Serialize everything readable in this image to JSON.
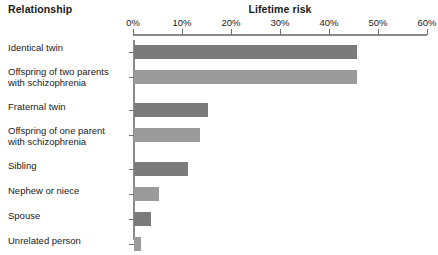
{
  "header": {
    "relationship_label": "Relationship",
    "lifetime_label": "Lifetime risk"
  },
  "axis": {
    "ticks": [
      "0%",
      "10%",
      "20%",
      "30%",
      "40%",
      "50%",
      "60%"
    ],
    "min": 0,
    "max": 60,
    "unit": "%"
  },
  "colors": {
    "bar_dark": "#7b7b7b",
    "bar_light": "#9b9b9b",
    "axis": "#8b8b8b",
    "text": "#1a1a1a",
    "background": "#ffffff"
  },
  "chart_data": {
    "type": "bar",
    "orientation": "horizontal",
    "title": "Lifetime risk",
    "xlabel": "Lifetime risk",
    "ylabel": "Relationship",
    "xlim": [
      0,
      60
    ],
    "xticks": [
      0,
      10,
      20,
      30,
      40,
      50,
      60
    ],
    "xticklabels": [
      "0%",
      "10%",
      "20%",
      "30%",
      "40%",
      "50%",
      "60%"
    ],
    "grid": false,
    "legend": false,
    "categories": [
      "Identical twin",
      "Offspring of two parents with schizophrenia",
      "Fraternal twin",
      "Offspring of one parent with schizophrenia",
      "Sibling",
      "Nephew or niece",
      "Spouse",
      "Unrelated person"
    ],
    "values": [
      45.5,
      45.5,
      15,
      13.5,
      11,
      5,
      3.5,
      1.5
    ]
  },
  "rows": [
    {
      "label_line1": "Identical twin",
      "label_line2": "",
      "value": 45.5,
      "shade": "dark"
    },
    {
      "label_line1": "Offspring of two parents",
      "label_line2": "with schizophrenia",
      "value": 45.5,
      "shade": "light"
    },
    {
      "label_line1": "Fraternal twin",
      "label_line2": "",
      "value": 15,
      "shade": "dark"
    },
    {
      "label_line1": "Offspring of one parent",
      "label_line2": "with schizophrenia",
      "value": 13.5,
      "shade": "light"
    },
    {
      "label_line1": "Sibling",
      "label_line2": "",
      "value": 11,
      "shade": "dark"
    },
    {
      "label_line1": "Nephew or niece",
      "label_line2": "",
      "value": 5,
      "shade": "light"
    },
    {
      "label_line1": "Spouse",
      "label_line2": "",
      "value": 3.5,
      "shade": "dark"
    },
    {
      "label_line1": "Unrelated person",
      "label_line2": "",
      "value": 1.5,
      "shade": "light"
    }
  ]
}
